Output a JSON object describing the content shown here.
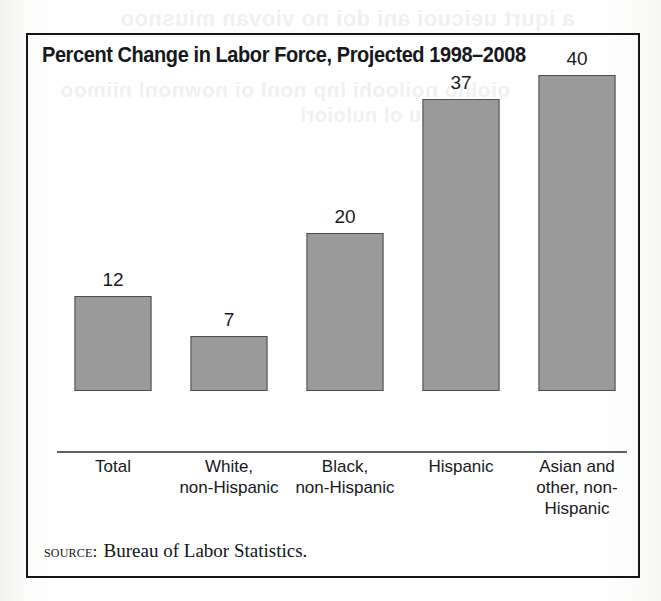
{
  "figure": {
    "title": "Percent Change in Labor Force, Projected 1998–2008",
    "source_label": "source:",
    "source_text": "Bureau of Labor Statistics.",
    "border_color": "#14161a"
  },
  "bleed_through": {
    "line1": "a iqurt ueicuoi ani doi no viovan miusnoo",
    "line2": "oiolno noiloohi lnp nonl oi nownonl niimoo",
    "line3": "lu ol nuloiorl"
  },
  "chart_data": {
    "type": "bar",
    "title": "Percent Change in Labor Force, Projected 1998–2008",
    "xlabel": "",
    "ylabel": "",
    "ylim": [
      0,
      44
    ],
    "grid": false,
    "legend": "none",
    "bar_fill": "#9a9a9a",
    "bar_outline": "#4c4e50",
    "categories": [
      "Total",
      "White, non-Hispanic",
      "Black, non-Hispanic",
      "Hispanic",
      "Asian and other, non-Hispanic"
    ],
    "category_lines": [
      [
        "Total"
      ],
      [
        "White,",
        "non-Hispanic"
      ],
      [
        "Black,",
        "non-Hispanic"
      ],
      [
        "Hispanic"
      ],
      [
        "Asian and",
        "other, non-",
        "Hispanic"
      ]
    ],
    "values": [
      12,
      7,
      20,
      37,
      40
    ],
    "value_labels": [
      "12",
      "7",
      "20",
      "37",
      "40"
    ]
  }
}
